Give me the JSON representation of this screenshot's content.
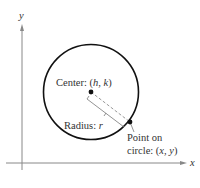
{
  "diagram": {
    "type": "circle-on-coordinate-plane",
    "axes": {
      "x_label": "x",
      "y_label": "y",
      "color": "#888888"
    },
    "circle": {
      "stroke_color": "#111111",
      "center_label_prefix": "Center: (",
      "center_h": "h",
      "center_sep": ", ",
      "center_k": "k",
      "center_label_suffix": ")",
      "radius_label_prefix": "Radius: ",
      "radius_symbol": "r",
      "point_label_line1": "Point on",
      "point_label_line2_prefix": "circle: (",
      "point_x": "x",
      "point_sep": ", ",
      "point_y": "y",
      "point_label_line2_suffix": ")"
    },
    "colors": {
      "radius_dash": "#999999",
      "bracket": "#777777",
      "text": "#333333"
    }
  }
}
